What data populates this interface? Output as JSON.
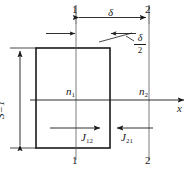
{
  "figure": {
    "type": "technical-line-diagram",
    "background_color": "#ffffff",
    "line_color": "#1a1a1a"
  },
  "labels": {
    "plane_1_top": "1",
    "plane_2_top": "2",
    "plane_1_bottom": "1",
    "plane_2_bottom": "2",
    "delta": "δ",
    "delta_half_numerator": "δ",
    "delta_half_denominator": "2",
    "area": "S=1",
    "node_1": "n",
    "node_1_sub": "1",
    "node_2": "n",
    "node_2_sub": "2",
    "current_12": "J",
    "current_12_sub": "12",
    "current_21": "J",
    "current_21_sub": "21",
    "axis_x": "x"
  },
  "geometry": {
    "rect": {
      "left": 36,
      "top": 48,
      "right": 110,
      "bottom": 148
    },
    "plane_1_x": 76,
    "plane_2_x": 149,
    "axis_y": 100,
    "axis_arrow_x": 184,
    "dim_delta_y": 17,
    "dim_s_x": 20,
    "current_arrow_y": 128
  }
}
